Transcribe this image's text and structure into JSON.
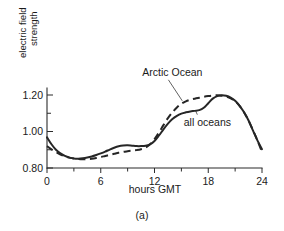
{
  "figure": {
    "caption": "(a)"
  },
  "chart_data": {
    "type": "line",
    "title": "",
    "xlabel": "hours GMT",
    "ylabel_line1": "electric field",
    "ylabel_line2": "strength",
    "xlim": [
      0,
      24
    ],
    "ylim": [
      0.8,
      1.24
    ],
    "xticks": [
      0,
      6,
      12,
      18,
      24
    ],
    "xtick_labels": [
      "0",
      "6",
      "12",
      "18",
      "24"
    ],
    "xminor_ticks": [
      3,
      9,
      15,
      21
    ],
    "yticks": [
      0.8,
      1.0,
      1.2
    ],
    "ytick_labels": [
      "0.80",
      "1.00",
      "1.20"
    ],
    "yminor_ticks": [
      0.9,
      1.1
    ],
    "grid": false,
    "legend_position": "inline-annotation",
    "annotations": [
      {
        "text": "Arctic Ocean",
        "series": "Arctic Ocean",
        "x": 14.0,
        "y": 1.305,
        "leader_to_x": 15.1,
        "leader_to_y": 1.168
      },
      {
        "text": "all oceans",
        "series": "all oceans",
        "x": 17.9,
        "y": 1.032,
        "leader_to_x": 16.6,
        "leader_to_y": 1.112
      }
    ],
    "series": [
      {
        "name": "all oceans",
        "style": "solid",
        "color": "#262626",
        "x": [
          0,
          0.5,
          1,
          1.5,
          2,
          2.5,
          3,
          3.5,
          4,
          4.5,
          5,
          5.5,
          6,
          6.5,
          7,
          7.5,
          8,
          8.5,
          9,
          9.5,
          10,
          10.5,
          11,
          11.5,
          12,
          12.5,
          13,
          13.5,
          14,
          14.5,
          15,
          15.5,
          16,
          16.5,
          17,
          17.5,
          18,
          18.5,
          19,
          19.5,
          20,
          20.5,
          21,
          21.5,
          22,
          22.5,
          23,
          23.5,
          24
        ],
        "y": [
          0.968,
          0.93,
          0.9,
          0.88,
          0.866,
          0.857,
          0.852,
          0.851,
          0.853,
          0.857,
          0.863,
          0.871,
          0.88,
          0.89,
          0.901,
          0.911,
          0.919,
          0.923,
          0.924,
          0.922,
          0.92,
          0.92,
          0.922,
          0.93,
          0.948,
          0.978,
          1.012,
          1.043,
          1.068,
          1.086,
          1.098,
          1.105,
          1.11,
          1.113,
          1.117,
          1.13,
          1.155,
          1.18,
          1.194,
          1.199,
          1.196,
          1.186,
          1.168,
          1.141,
          1.105,
          1.06,
          1.005,
          0.95,
          0.903
        ]
      },
      {
        "name": "Arctic Ocean",
        "style": "dashed",
        "color": "#262626",
        "x": [
          0,
          0.5,
          1,
          1.5,
          2,
          2.5,
          3,
          3.5,
          4,
          4.5,
          5,
          5.5,
          6,
          6.5,
          7,
          7.5,
          8,
          8.5,
          9,
          9.5,
          10,
          10.5,
          11,
          11.5,
          12,
          12.5,
          13,
          13.5,
          14,
          14.5,
          15,
          15.5,
          16,
          16.5,
          17,
          17.5,
          18,
          18.5,
          19,
          19.5,
          20,
          20.5,
          21,
          21.5,
          22,
          22.5,
          23,
          23.5,
          24
        ],
        "y": [
          0.92,
          0.902,
          0.887,
          0.874,
          0.864,
          0.857,
          0.852,
          0.849,
          0.848,
          0.849,
          0.851,
          0.855,
          0.86,
          0.866,
          0.872,
          0.878,
          0.884,
          0.888,
          0.892,
          0.895,
          0.898,
          0.903,
          0.912,
          0.93,
          0.958,
          0.995,
          1.035,
          1.073,
          1.105,
          1.132,
          1.152,
          1.165,
          1.174,
          1.18,
          1.185,
          1.19,
          1.194,
          1.197,
          1.198,
          1.196,
          1.191,
          1.182,
          1.166,
          1.14,
          1.104,
          1.059,
          1.006,
          0.95,
          0.888
        ]
      }
    ]
  }
}
